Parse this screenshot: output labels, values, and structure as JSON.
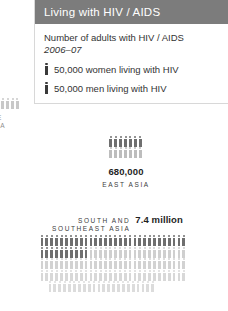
{
  "legend": {
    "title": "Living with HIV / AIDS",
    "caption": "Number of adults with HIV / AIDS",
    "year": "2006–07",
    "items": [
      {
        "icon": "person-figure-icon",
        "label": "50,000 women living with HIV"
      },
      {
        "icon": "person-figure-icon",
        "label": "50,000 men living with HIV"
      }
    ],
    "header_color": "#7c7c7c"
  },
  "chart_data": {
    "type": "pictogram",
    "title": "Living with HIV / AIDS",
    "subtitle": "Number of adults with HIV / AIDS",
    "period": "2006–07",
    "unit_value": 50000,
    "unit_label": "50,000 adults per figure",
    "legend": [
      {
        "name": "women living with HIV",
        "value_per_icon": 50000,
        "color": "#b9b9b9"
      },
      {
        "name": "men living with HIV",
        "value_per_icon": 50000,
        "color": "#6f6f6f"
      }
    ],
    "clusters": [
      {
        "region": "EAST ASIA",
        "amount_label": "680,000",
        "amount_value": 680000,
        "rows": [
          {
            "series": "men",
            "count": 7,
            "color": "#6f6f6f"
          },
          {
            "series": "women",
            "count": 7,
            "color": "#bdbdbd"
          }
        ]
      },
      {
        "region_lines": [
          "SOUTH AND",
          "SOUTHEAST ASIA"
        ],
        "region": "SOUTH AND SOUTHEAST ASIA",
        "amount_label": "7.4 million",
        "amount_value": 7400000,
        "rows": [
          {
            "series": "men",
            "count": 30,
            "color": "#6f6f6f",
            "indent": 0
          },
          {
            "series": "men-women",
            "count_dark": 10,
            "count": 30,
            "color": "#6f6f6f",
            "color_light": "#cfcfcf",
            "indent": 0
          },
          {
            "series": "women",
            "count": 30,
            "color": "#d2d2d2",
            "indent": 0
          },
          {
            "series": "women",
            "count": 30,
            "color": "#d8d8d8",
            "indent": 0
          },
          {
            "series": "women",
            "count": 22,
            "color": "#dcdcdc",
            "indent": 8
          }
        ]
      },
      {
        "region_lines": [
          "PE",
          "SIA"
        ],
        "clipped": true,
        "rows": [
          {
            "series": "women",
            "count": 6,
            "color": "#c8c8c8"
          }
        ]
      }
    ]
  }
}
